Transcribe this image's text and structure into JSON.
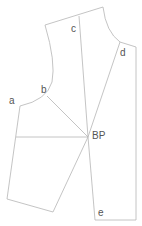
{
  "diagram": {
    "type": "bodice dart manipulation pattern",
    "line_color": "#b5b5b5",
    "label_color": "#555555",
    "labels": {
      "a": "a",
      "b": "b",
      "c": "c",
      "d": "d",
      "bp": "BP",
      "e": "e"
    },
    "points": {
      "a": [
        20,
        106
      ],
      "b": [
        47,
        96
      ],
      "c_top": [
        79,
        16
      ],
      "d": [
        120,
        42
      ],
      "bp": [
        88,
        137
      ],
      "e": [
        95,
        220
      ]
    }
  }
}
